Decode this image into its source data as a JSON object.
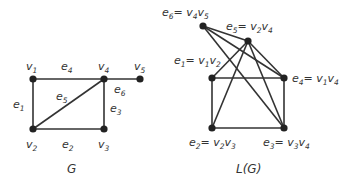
{
  "graph_G": {
    "caption": "G",
    "vertices": [
      {
        "id": "v1",
        "label": "v",
        "sub": "1",
        "x": 33,
        "y": 79,
        "lx": 26,
        "ly": 70
      },
      {
        "id": "v2",
        "label": "v",
        "sub": "2",
        "x": 33,
        "y": 129,
        "lx": 26,
        "ly": 148
      },
      {
        "id": "v3",
        "label": "v",
        "sub": "3",
        "x": 104,
        "y": 129,
        "lx": 98,
        "ly": 148
      },
      {
        "id": "v4",
        "label": "v",
        "sub": "4",
        "x": 104,
        "y": 79,
        "lx": 98,
        "ly": 70
      },
      {
        "id": "v5",
        "label": "v",
        "sub": "5",
        "x": 140,
        "y": 79,
        "lx": 134,
        "ly": 70
      }
    ],
    "edges": [
      {
        "id": "e1",
        "from": "v1",
        "to": "v2",
        "label": "e",
        "sub": "1",
        "lx": 13,
        "ly": 108
      },
      {
        "id": "e2",
        "from": "v2",
        "to": "v3",
        "label": "e",
        "sub": "2",
        "lx": 62,
        "ly": 148
      },
      {
        "id": "e3",
        "from": "v3",
        "to": "v4",
        "label": "e",
        "sub": "3",
        "lx": 110,
        "ly": 112
      },
      {
        "id": "e4",
        "from": "v1",
        "to": "v4",
        "label": "e",
        "sub": "4",
        "lx": 61,
        "ly": 70
      },
      {
        "id": "e5",
        "from": "v2",
        "to": "v4",
        "label": "e",
        "sub": "5",
        "lx": 56,
        "ly": 100
      },
      {
        "id": "e6",
        "from": "v4",
        "to": "v5",
        "label": "e",
        "sub": "6",
        "lx": 114,
        "ly": 93
      }
    ]
  },
  "graph_LG": {
    "caption": "L(G)",
    "vertices": [
      {
        "id": "e1",
        "x": 212,
        "y": 78,
        "text": "e",
        "sub": "1",
        "rest": "= v",
        "rsub1": "1",
        "rest2": "v",
        "rsub2": "2",
        "lx": 174,
        "ly": 64
      },
      {
        "id": "e2",
        "x": 212,
        "y": 128,
        "text": "e",
        "sub": "2",
        "rest": "= v",
        "rsub1": "2",
        "rest2": "v",
        "rsub2": "3",
        "lx": 189,
        "ly": 146
      },
      {
        "id": "e3",
        "x": 284,
        "y": 128,
        "text": "e",
        "sub": "3",
        "rest": "= v",
        "rsub1": "3",
        "rest2": "v",
        "rsub2": "4",
        "lx": 263,
        "ly": 146
      },
      {
        "id": "e4",
        "x": 284,
        "y": 78,
        "text": "e",
        "sub": "4",
        "rest": "= v",
        "rsub1": "1",
        "rest2": "v",
        "rsub2": "4",
        "lx": 292,
        "ly": 82
      },
      {
        "id": "e5",
        "x": 248,
        "y": 41,
        "text": "e",
        "sub": "5",
        "rest": "= v",
        "rsub1": "2",
        "rest2": "v",
        "rsub2": "4",
        "lx": 226,
        "ly": 30
      },
      {
        "id": "e6",
        "x": 203,
        "y": 26,
        "text": "e",
        "sub": "6",
        "rest": "= v",
        "rsub1": "4",
        "rest2": "v",
        "rsub2": "5",
        "lx": 162,
        "ly": 16
      }
    ],
    "edges": [
      [
        "e1",
        "e2"
      ],
      [
        "e1",
        "e4"
      ],
      [
        "e1",
        "e5"
      ],
      [
        "e2",
        "e3"
      ],
      [
        "e2",
        "e5"
      ],
      [
        "e3",
        "e4"
      ],
      [
        "e3",
        "e5"
      ],
      [
        "e3",
        "e6"
      ],
      [
        "e4",
        "e5"
      ],
      [
        "e4",
        "e6"
      ],
      [
        "e5",
        "e6"
      ]
    ]
  },
  "captions": {
    "G_x": 67,
    "G_y": 173,
    "LG_x": 236,
    "LG_y": 173
  }
}
